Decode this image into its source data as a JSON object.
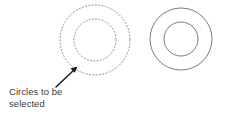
{
  "figure": {
    "background_color": "#ffffff",
    "annotation": {
      "text": "Circles to be\nselected",
      "line1": "Circles to be",
      "line2": "selected",
      "color": "#3b3b3b"
    },
    "arrow": {
      "name": "leader-arrow",
      "color": "#1a1a1a",
      "from_x": 56,
      "from_y": 87,
      "to_x": 77,
      "to_y": 67
    },
    "shapes": [
      {
        "name": "dashed-annulus",
        "label": "Circles to be selected",
        "style": "dotted",
        "stroke_color": "#8c8c8c",
        "center_x": 95,
        "center_y": 40,
        "outer_radius": 35,
        "inner_radius": 21
      },
      {
        "name": "solid-annulus",
        "label": "Result",
        "style": "solid",
        "stroke_color": "#6b6b6b",
        "center_x": 181,
        "center_y": 39,
        "outer_radius": 31,
        "inner_radius": 17
      }
    ]
  }
}
